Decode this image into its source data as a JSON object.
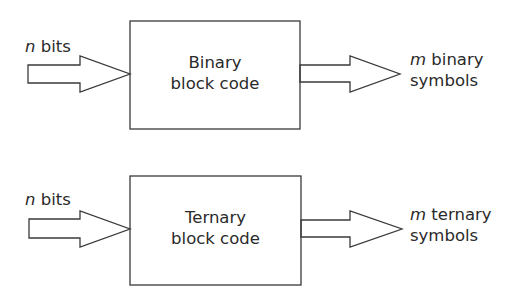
{
  "diagrams": [
    {
      "input": {
        "var": "n",
        "text": " bits"
      },
      "block": {
        "line1": "Binary",
        "line2": "block code"
      },
      "output": {
        "var": "m",
        "line1_text": " binary",
        "line2": "symbols"
      }
    },
    {
      "input": {
        "var": "n",
        "text": " bits"
      },
      "block": {
        "line1": "Ternary",
        "line2": "block code"
      },
      "output": {
        "var": "m",
        "line1_text": " ternary",
        "line2": "symbols"
      }
    }
  ],
  "colors": {
    "stroke": "#3a3a3a",
    "text": "#2a2a2a",
    "background": "#ffffff"
  }
}
